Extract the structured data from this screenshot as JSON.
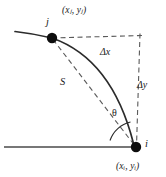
{
  "figure": {
    "type": "geometry-diagram",
    "background_color": "#ffffff",
    "stroke_color": "#2b2b2b",
    "dash_color": "#555555",
    "node_color": "#0d0d0d"
  },
  "labels": {
    "coord_j": "(xⱼ, yⱼ)",
    "coord_i": "(xᵢ, yᵢ)",
    "node_j": "j",
    "node_i": "i",
    "delta_x": "Δx",
    "delta_y": "Δy",
    "arc_length": "S",
    "angle": "θ"
  },
  "geometry": {
    "node_j": {
      "x": 52,
      "y": 38,
      "radius": 5.2
    },
    "node_i": {
      "x": 136,
      "y": 147,
      "radius": 5.2
    },
    "baseline": {
      "x1": 4,
      "y1": 147,
      "x2": 136,
      "y2": 147
    },
    "dashed_horizontal": {
      "x1": 52,
      "y1": 38,
      "x2": 141,
      "y2": 36
    },
    "dashed_vertical": {
      "x1": 139,
      "y1": 34,
      "x2": 136,
      "y2": 147
    },
    "chord": {
      "x1": 52,
      "y1": 38,
      "x2": 136,
      "y2": 147
    },
    "arc": {
      "start_x": 52,
      "start_y": 38,
      "end_x": 136,
      "end_y": 147,
      "control_x": 112,
      "control_y": 60
    },
    "arc_tail": {
      "x1": 52,
      "y1": 38,
      "x2": 16,
      "y2": 31
    },
    "angle_arc_radius": 26
  }
}
